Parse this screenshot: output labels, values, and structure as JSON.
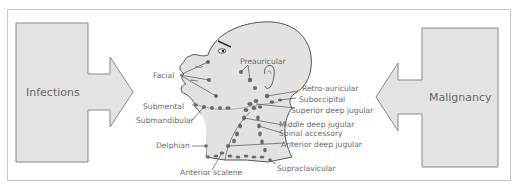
{
  "left_arrow": {
    "label": "Infections",
    "direction": "right"
  },
  "right_arrow": {
    "label": "Malignancy",
    "direction": "left"
  },
  "figure": {
    "node_color": "#6b6b6b",
    "fill_color": "#e2e2e2",
    "line_color": "#7a7a7a"
  },
  "labels": {
    "facial": "Facial",
    "preauricular": "Preauricular",
    "retro_auricular": "Retro-auricular",
    "suboccipital": "Suboccipital",
    "superior_deep_jugular": "Superior deep jugular",
    "middle_deep_jugular": "Middle deep jugular",
    "spinal_accessory": "Spinal accessory",
    "anterior_deep_jugular": "Anterior deep jugular",
    "supraclavicular": "Supraclavicular",
    "anterior_scalene": "Anterior scalene",
    "delphian": "Delphian",
    "submandibular": "Submandibular",
    "submental": "Submental"
  }
}
